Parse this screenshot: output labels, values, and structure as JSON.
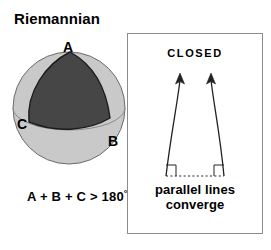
{
  "figure": {
    "title": "Riemannian",
    "background_color": "#ffffff"
  },
  "sphere": {
    "name": "riemannian-sphere",
    "fill_color": "#c9c9c9",
    "outline_color": "#555555",
    "triangle_fill_color": "#464646",
    "triangle_outline_color": "#222222",
    "vertices": [
      {
        "id": "A",
        "label": "A"
      },
      {
        "id": "B",
        "label": "B"
      },
      {
        "id": "C",
        "label": "C"
      }
    ],
    "angle_sum": {
      "expression": "A + B + C > 180",
      "degree_symbol": "°"
    }
  },
  "panel": {
    "heading": "CLOSED",
    "caption_line1": "parallel lines",
    "caption_line2": "converge",
    "border_color": "#8c8c8c",
    "line_color": "#222222",
    "baseline_style": "dotted"
  }
}
